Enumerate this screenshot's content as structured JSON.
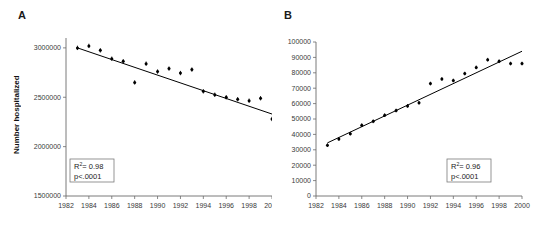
{
  "figure": {
    "background": "#ffffff",
    "accent": "#000000",
    "axis_color": "#6b6b6b"
  },
  "panels": [
    {
      "label": "A",
      "ylabel": "Number hospitalized",
      "stats": {
        "r2_prefix": "R",
        "r2_sup": "2",
        "r2_value": "= 0.98",
        "pvalue": "p<.0001"
      }
    },
    {
      "label": "B",
      "ylabel": "",
      "stats": {
        "r2_prefix": "R",
        "r2_sup": "2",
        "r2_value": "= 0.96",
        "pvalue": "p<.0001"
      }
    }
  ],
  "chart_data": [
    {
      "type": "scatter",
      "panel": "A",
      "title": "",
      "xlabel": "",
      "ylabel": "Number hospitalized",
      "xlim": [
        1982,
        2000
      ],
      "ylim": [
        1500000,
        3100000
      ],
      "xticks": [
        1982,
        1984,
        1986,
        1988,
        1990,
        1992,
        1994,
        1996,
        1998,
        2000
      ],
      "xticklabels": [
        "1982",
        "1984",
        "1986",
        "1988",
        "1990",
        "1992",
        "1994",
        "1996",
        "1998",
        "2000"
      ],
      "yticks": [
        1500000,
        2000000,
        2500000,
        3000000
      ],
      "yticklabels": [
        "1500000",
        "2000000",
        "2500000",
        "3000000"
      ],
      "grid": false,
      "legend": "none",
      "error_bars": true,
      "x": [
        1983,
        1984,
        1985,
        1986,
        1987,
        1988,
        1989,
        1990,
        1991,
        1992,
        1993,
        1994,
        1995,
        1996,
        1997,
        1998,
        1999,
        2000
      ],
      "values": [
        3000000,
        3020000,
        2975000,
        2890000,
        2865000,
        2650000,
        2840000,
        2760000,
        2790000,
        2745000,
        2780000,
        2560000,
        2525000,
        2500000,
        2480000,
        2465000,
        2490000,
        2280000
      ],
      "yerr": [
        22000,
        22000,
        22000,
        22000,
        22000,
        22000,
        22000,
        22000,
        22000,
        22000,
        22000,
        22000,
        22000,
        22000,
        22000,
        22000,
        22000,
        22000
      ],
      "trendline": {
        "x": [
          1983,
          2000
        ],
        "y": [
          3000000,
          2330000
        ]
      },
      "annotations": [
        {
          "text": "R2= 0.98",
          "position": "lower-left"
        },
        {
          "text": "p<.0001",
          "position": "lower-left"
        }
      ]
    },
    {
      "type": "scatter",
      "panel": "B",
      "title": "",
      "xlabel": "",
      "ylabel": "",
      "xlim": [
        1982,
        2000
      ],
      "ylim": [
        0,
        100000
      ],
      "xticks": [
        1982,
        1984,
        1986,
        1988,
        1990,
        1992,
        1994,
        1996,
        1998,
        2000
      ],
      "xticklabels": [
        "1982",
        "1984",
        "1986",
        "1988",
        "1990",
        "1992",
        "1994",
        "1996",
        "1998",
        "2000"
      ],
      "yticks": [
        0,
        10000,
        20000,
        30000,
        40000,
        50000,
        60000,
        70000,
        80000,
        90000,
        100000
      ],
      "yticklabels": [
        "0",
        "10000",
        "20000",
        "30000",
        "40000",
        "50000",
        "60000",
        "70000",
        "80000",
        "90000",
        "100000"
      ],
      "grid": false,
      "legend": "none",
      "error_bars": true,
      "x": [
        1983,
        1984,
        1985,
        1986,
        1987,
        1988,
        1989,
        1990,
        1991,
        1992,
        1993,
        1994,
        1995,
        1996,
        1997,
        1998,
        1999,
        2000
      ],
      "values": [
        33000,
        37000,
        40500,
        46000,
        48500,
        52500,
        55500,
        58500,
        60500,
        73000,
        76000,
        75000,
        79500,
        83500,
        88500,
        87500,
        86000,
        86000
      ],
      "yerr": [
        1200,
        1200,
        1200,
        1200,
        1200,
        1200,
        1200,
        1200,
        1200,
        1200,
        1200,
        1200,
        1200,
        1200,
        1200,
        1200,
        1200,
        1200
      ],
      "trendline": {
        "x": [
          1983,
          2000
        ],
        "y": [
          34500,
          94000
        ]
      },
      "annotations": [
        {
          "text": "R2= 0.96",
          "position": "lower-right"
        },
        {
          "text": "p<.0001",
          "position": "lower-right"
        }
      ]
    }
  ]
}
